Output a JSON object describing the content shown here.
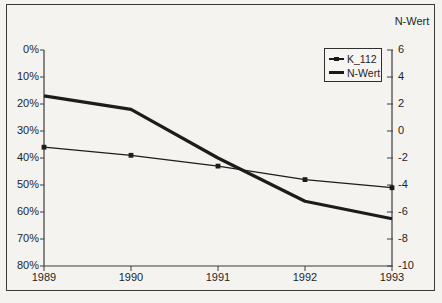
{
  "chart_data": {
    "type": "line",
    "title": "",
    "x": [
      1989,
      1990,
      1991,
      1992,
      1993
    ],
    "x_tick_labels": [
      "1989",
      "1990",
      "1991",
      "1992",
      "1993"
    ],
    "series": [
      {
        "name": "K_112",
        "axis": "left",
        "values": [
          36,
          39,
          43,
          48,
          51
        ],
        "unit": "%",
        "style": "thin-line-square-markers"
      },
      {
        "name": "N-Wert",
        "axis": "right",
        "values": [
          2.6,
          1.6,
          -2.0,
          -5.2,
          -6.5
        ],
        "style": "thick-line"
      }
    ],
    "left_axis": {
      "min": 0,
      "max": 80,
      "inverted": true,
      "unit": "%",
      "tick_labels": [
        "0%",
        "10%",
        "20%",
        "30%",
        "40%",
        "50%",
        "60%",
        "70%",
        "80%"
      ]
    },
    "right_axis": {
      "title": "N-Wert",
      "min": -10,
      "max": 6,
      "tick_labels": [
        "6",
        "4",
        "2",
        "0",
        "-2",
        "-4",
        "-6",
        "-8",
        "-10"
      ]
    },
    "legend": {
      "position": "inside-top-right",
      "entries": [
        {
          "label": "K_112"
        },
        {
          "label": "N-Wert"
        }
      ]
    },
    "grid": false,
    "colors": {
      "line": "#1c1c1c",
      "axis": "#3c3c3c",
      "background": "#f4f3f0",
      "text": "#1f1f1f"
    }
  }
}
